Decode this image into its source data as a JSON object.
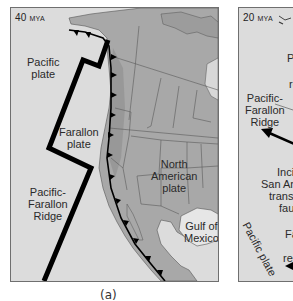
{
  "figure": {
    "caption": "(a)",
    "panels": [
      {
        "id": "a",
        "age_value": "40",
        "age_unit": "MYA",
        "labels": {
          "pacific_plate_1": "Pacific",
          "pacific_plate_2": "plate",
          "farallon_plate_1": "Farallon",
          "farallon_plate_2": "plate",
          "ridge_1": "Pacific-",
          "ridge_2": "Farallon",
          "ridge_3": "Ridge",
          "north_american_1": "North",
          "north_american_2": "American",
          "north_american_3": "plate",
          "gulf_1": "Gulf of",
          "gulf_2": "Mexico"
        }
      },
      {
        "id": "b",
        "age_value": "20",
        "age_unit": "MYA",
        "labels": {
          "partial_p": "P",
          "partial_re": "re",
          "ridge_1": "Pacific-",
          "ridge_2": "Farallon",
          "ridge_3": "Ridge",
          "incipient_1": "Incipi",
          "incipient_2": "San And",
          "incipient_3": "transfo",
          "incipient_4": "faul",
          "pacific_plate": "Pacific plate",
          "farallon_1": "Fa",
          "farallon_2": "p",
          "farallon_3": "ren"
        }
      }
    ]
  },
  "colors": {
    "ocean": "#dcdcdc",
    "land": "#a9a9a9",
    "land_dark": "#8f8f8f",
    "boundary_line": "#000000",
    "state_line": "#5a5a5a"
  }
}
